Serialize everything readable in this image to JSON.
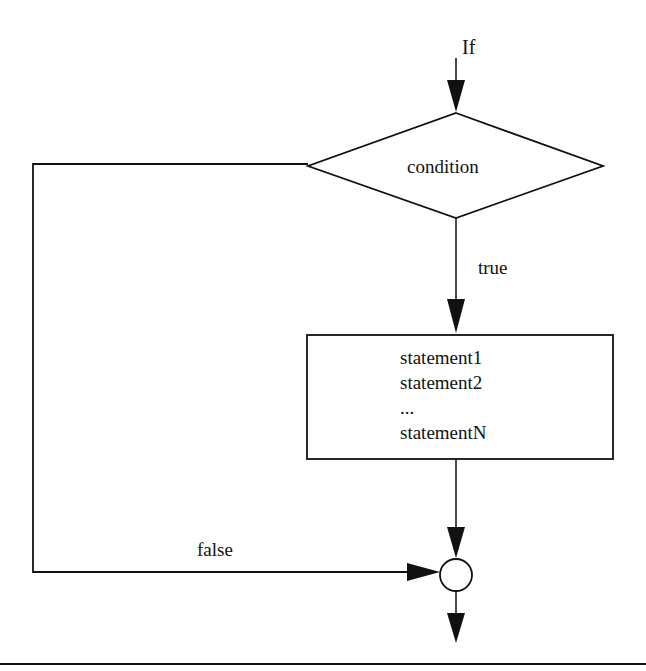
{
  "diagram": {
    "type": "flowchart",
    "title": "If",
    "nodes": {
      "entry_label": "If",
      "decision": {
        "label": "condition",
        "shape": "diamond"
      },
      "process": {
        "shape": "rectangle",
        "lines": [
          "statement1",
          "statement2",
          "...",
          "statementN"
        ]
      },
      "junction": {
        "shape": "circle"
      }
    },
    "edges": {
      "true_label": "true",
      "false_label": "false"
    },
    "colors": {
      "stroke": "#111111",
      "background": "#ffffff"
    }
  }
}
